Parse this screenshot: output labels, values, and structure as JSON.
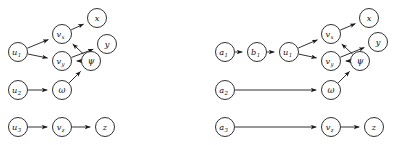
{
  "figure": {
    "background": "#ffffff",
    "edge_color": "#1a1a1a",
    "node_fill": "#ffffff",
    "node_stroke": "#1a1a1a",
    "label_color": "#111111"
  },
  "panels": [
    {
      "id": "left-panel",
      "name": "causal-graph-left",
      "nodes": [
        {
          "id": "u1",
          "base": "u",
          "sub": "1",
          "greek": false,
          "cx": 18,
          "cy": 52,
          "r": 9.5
        },
        {
          "id": "u2",
          "base": "u",
          "sub": "2",
          "greek": false,
          "cx": 18,
          "cy": 90,
          "r": 9.5
        },
        {
          "id": "u3",
          "base": "u",
          "sub": "3",
          "greek": false,
          "cx": 18,
          "cy": 127,
          "r": 9.5
        },
        {
          "id": "vx",
          "base": "v",
          "sub": "x",
          "greek": false,
          "cx": 62,
          "cy": 34,
          "r": 9.5
        },
        {
          "id": "vy",
          "base": "v",
          "sub": "y",
          "greek": false,
          "cx": 62,
          "cy": 61,
          "r": 9.5
        },
        {
          "id": "vz",
          "base": "v",
          "sub": "z",
          "greek": false,
          "cx": 62,
          "cy": 127,
          "r": 9.5
        },
        {
          "id": "w",
          "base": "ω",
          "sub": "",
          "greek": true,
          "cx": 62,
          "cy": 90,
          "r": 9.5
        },
        {
          "id": "psi",
          "base": "ψ",
          "sub": "",
          "greek": true,
          "cx": 91,
          "cy": 61,
          "r": 9.5
        },
        {
          "id": "x",
          "base": "x",
          "sub": "",
          "greek": false,
          "cx": 97,
          "cy": 18,
          "r": 9.5
        },
        {
          "id": "y",
          "base": "y",
          "sub": "",
          "greek": false,
          "cx": 107,
          "cy": 44,
          "r": 9.5
        },
        {
          "id": "z",
          "base": "z",
          "sub": "",
          "greek": false,
          "cx": 105,
          "cy": 127,
          "r": 9.5
        }
      ],
      "edges": [
        {
          "from": "u1",
          "to": "vx"
        },
        {
          "from": "u1",
          "to": "vy"
        },
        {
          "from": "vx",
          "to": "x"
        },
        {
          "from": "psi",
          "to": "vx"
        },
        {
          "from": "psi",
          "to": "vy"
        },
        {
          "from": "vy",
          "to": "y"
        },
        {
          "from": "u2",
          "to": "w"
        },
        {
          "from": "w",
          "to": "psi"
        },
        {
          "from": "u3",
          "to": "vz"
        },
        {
          "from": "vz",
          "to": "z"
        }
      ]
    },
    {
      "id": "right-panel",
      "name": "causal-graph-right",
      "nodes": [
        {
          "id": "a1",
          "base": "a",
          "sub": "1",
          "greek": false,
          "cx": 28,
          "cy": 52,
          "r": 9.5
        },
        {
          "id": "a2",
          "base": "a",
          "sub": "2",
          "greek": false,
          "cx": 28,
          "cy": 90,
          "r": 9.5
        },
        {
          "id": "a3",
          "base": "a",
          "sub": "3",
          "greek": false,
          "cx": 28,
          "cy": 127,
          "r": 9.5
        },
        {
          "id": "b1",
          "base": "b",
          "sub": "1",
          "greek": false,
          "cx": 60,
          "cy": 52,
          "r": 9.5
        },
        {
          "id": "u1",
          "base": "u",
          "sub": "1",
          "greek": false,
          "cx": 92,
          "cy": 52,
          "r": 9.5
        },
        {
          "id": "vx",
          "base": "v",
          "sub": "x",
          "greek": false,
          "cx": 134,
          "cy": 34,
          "r": 9.5
        },
        {
          "id": "vy",
          "base": "v",
          "sub": "y",
          "greek": false,
          "cx": 134,
          "cy": 61,
          "r": 9.5
        },
        {
          "id": "vz",
          "base": "v",
          "sub": "z",
          "greek": false,
          "cx": 134,
          "cy": 127,
          "r": 9.5
        },
        {
          "id": "w",
          "base": "ω",
          "sub": "",
          "greek": true,
          "cx": 134,
          "cy": 90,
          "r": 9.5
        },
        {
          "id": "psi",
          "base": "ψ",
          "sub": "",
          "greek": true,
          "cx": 163,
          "cy": 61,
          "r": 9.5
        },
        {
          "id": "x",
          "base": "x",
          "sub": "",
          "greek": false,
          "cx": 172,
          "cy": 18,
          "r": 9.5
        },
        {
          "id": "y",
          "base": "y",
          "sub": "",
          "greek": false,
          "cx": 181,
          "cy": 42,
          "r": 9.5
        },
        {
          "id": "z",
          "base": "z",
          "sub": "",
          "greek": false,
          "cx": 177,
          "cy": 127,
          "r": 9.5
        }
      ],
      "edges": [
        {
          "from": "a1",
          "to": "b1"
        },
        {
          "from": "b1",
          "to": "u1"
        },
        {
          "from": "u1",
          "to": "vx"
        },
        {
          "from": "u1",
          "to": "vy"
        },
        {
          "from": "vx",
          "to": "x"
        },
        {
          "from": "psi",
          "to": "vx"
        },
        {
          "from": "psi",
          "to": "vy"
        },
        {
          "from": "vy",
          "to": "y"
        },
        {
          "from": "a2",
          "to": "w"
        },
        {
          "from": "w",
          "to": "psi"
        },
        {
          "from": "a3",
          "to": "vz"
        },
        {
          "from": "vz",
          "to": "z"
        }
      ]
    }
  ]
}
